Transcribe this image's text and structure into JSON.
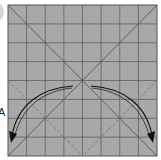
{
  "diagram": {
    "type": "origami-crease-pattern",
    "step_label": "A",
    "paper_color": "#a8a8a8",
    "grid_color": "#5a5a5a",
    "grid_divisions": 8,
    "square": {
      "x": 8,
      "y": 5,
      "size": 149
    },
    "creases": {
      "valley_diagonals": "solid",
      "lower_diamond": "dashed"
    },
    "arrows": [
      {
        "name": "left-fold-arrow",
        "direction": "down-left"
      },
      {
        "name": "right-fold-arrow",
        "direction": "down-right"
      }
    ]
  }
}
